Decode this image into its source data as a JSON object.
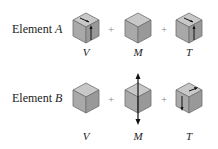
{
  "rows": [
    {
      "label_prefix": "Element ",
      "label_var": "A",
      "terms": [
        {
          "symbol": "V",
          "arrows": "shear-vertical"
        },
        {
          "symbol": "M",
          "arrows": "none"
        },
        {
          "symbol": "T",
          "arrows": "torsion-shear"
        }
      ]
    },
    {
      "label_prefix": "Element ",
      "label_var": "B",
      "terms": [
        {
          "symbol": "V",
          "arrows": "none"
        },
        {
          "symbol": "M",
          "arrows": "axial-tension"
        },
        {
          "symbol": "T",
          "arrows": "torsion-shear"
        }
      ]
    }
  ],
  "operators": [
    "+",
    "+"
  ],
  "colors": {
    "cube_light": "#c8c8c8",
    "cube_mid": "#a9a9a9",
    "cube_dark": "#8f8f8f",
    "edge": "#6e6e6e",
    "arrow": "#111111"
  }
}
